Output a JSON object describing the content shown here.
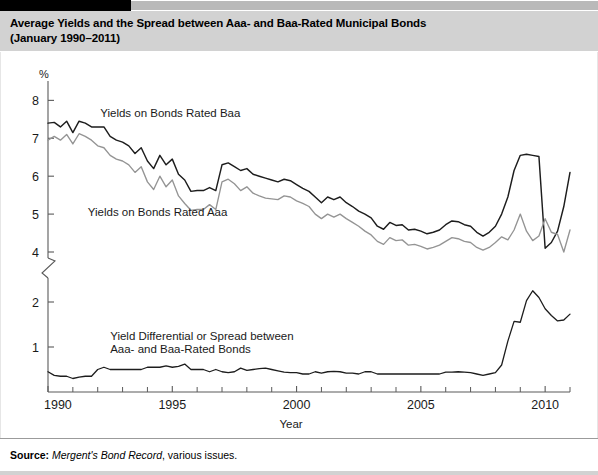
{
  "figure": {
    "title_line1": "Average Yields and the Spread between Aaa- and Baa-Rated Municipal Bonds",
    "title_line2": "(January 1990–2011)",
    "source_label": "Source:",
    "source_italic": "Mergent's Bond Record",
    "source_rest": ", various issues."
  },
  "chart_data": {
    "type": "line",
    "title": "Average Yields and the Spread between Aaa- and Baa-Rated Municipal Bonds (January 1990–2011)",
    "xlabel": "Year",
    "ylabel": "%",
    "grid": false,
    "legend_position": "inline-annotations",
    "axis_note": "y-axis has a scale break between 4 and 2",
    "xlim": [
      1990,
      2011
    ],
    "xticks_major": [
      1990,
      1995,
      2000,
      2005,
      2010
    ],
    "xticks_minor": [
      1991,
      1992,
      1993,
      1994,
      1996,
      1997,
      1998,
      1999,
      2001,
      2002,
      2003,
      2004,
      2006,
      2007,
      2008,
      2009,
      2011
    ],
    "yticks_upper": [
      4,
      5,
      6,
      7,
      8
    ],
    "yticks_lower": [
      1,
      2
    ],
    "ylim_upper": [
      4,
      8.3
    ],
    "ylim_lower": [
      0,
      2.4
    ],
    "annotations": [
      {
        "text": "Yields on Bonds Rated Baa",
        "x": 1992.1,
        "y": 7.55,
        "series": "baa"
      },
      {
        "text": "Yields on Bonds Rated Aaa",
        "x": 1991.6,
        "y": 4.95,
        "series": "aaa"
      },
      {
        "text_line1": "Yield Differential or Spread between",
        "text_line2": "Aaa- and Baa-Rated Bonds",
        "x": 1992.5,
        "y": 1.15,
        "series": "spread"
      }
    ],
    "x": [
      1990.0,
      1990.25,
      1990.5,
      1990.75,
      1991.0,
      1991.25,
      1991.5,
      1991.75,
      1992.0,
      1992.25,
      1992.5,
      1992.75,
      1993.0,
      1993.25,
      1993.5,
      1993.75,
      1994.0,
      1994.25,
      1994.5,
      1994.75,
      1995.0,
      1995.25,
      1995.5,
      1995.75,
      1996.0,
      1996.25,
      1996.5,
      1996.75,
      1997.0,
      1997.25,
      1997.5,
      1997.75,
      1998.0,
      1998.25,
      1998.5,
      1998.75,
      1999.0,
      1999.25,
      1999.5,
      1999.75,
      2000.0,
      2000.25,
      2000.5,
      2000.75,
      2001.0,
      2001.25,
      2001.5,
      2001.75,
      2002.0,
      2002.25,
      2002.5,
      2002.75,
      2003.0,
      2003.25,
      2003.5,
      2003.75,
      2004.0,
      2004.25,
      2004.5,
      2004.75,
      2005.0,
      2005.25,
      2005.5,
      2005.75,
      2006.0,
      2006.25,
      2006.5,
      2006.75,
      2007.0,
      2007.25,
      2007.5,
      2007.75,
      2008.0,
      2008.25,
      2008.5,
      2008.75,
      2009.0,
      2009.25,
      2009.5,
      2009.75,
      2010.0,
      2010.25,
      2010.5,
      2010.75,
      2011.0
    ],
    "series": [
      {
        "name": "Yields on Bonds Rated Baa",
        "key": "baa",
        "color": "#1d1d1d",
        "values": [
          7.4,
          7.42,
          7.3,
          7.45,
          7.15,
          7.45,
          7.4,
          7.3,
          7.3,
          7.3,
          7.05,
          6.95,
          6.9,
          6.8,
          6.6,
          6.75,
          6.4,
          6.2,
          6.55,
          6.3,
          6.45,
          6.05,
          5.9,
          5.6,
          5.62,
          5.62,
          5.7,
          5.62,
          6.3,
          6.35,
          6.25,
          6.15,
          6.2,
          6.05,
          6.0,
          5.95,
          5.9,
          5.85,
          5.92,
          5.88,
          5.78,
          5.68,
          5.6,
          5.45,
          5.3,
          5.45,
          5.38,
          5.45,
          5.3,
          5.2,
          5.08,
          5.0,
          4.9,
          4.68,
          4.6,
          4.78,
          4.7,
          4.72,
          4.58,
          4.6,
          4.55,
          4.48,
          4.52,
          4.58,
          4.72,
          4.82,
          4.8,
          4.72,
          4.68,
          4.52,
          4.42,
          4.52,
          4.68,
          5.0,
          5.45,
          6.15,
          6.55,
          6.58,
          6.55,
          6.52,
          4.1,
          4.25,
          4.55,
          5.2,
          6.1
        ]
      },
      {
        "name": "Yields on Bonds Rated Aaa",
        "key": "aaa",
        "color": "#949494",
        "values": [
          6.95,
          7.05,
          6.95,
          7.1,
          6.85,
          7.12,
          7.05,
          6.95,
          6.8,
          6.75,
          6.55,
          6.45,
          6.4,
          6.3,
          6.1,
          6.25,
          5.85,
          5.65,
          6.0,
          5.72,
          5.9,
          5.48,
          5.28,
          5.1,
          5.12,
          5.12,
          5.25,
          5.12,
          5.85,
          5.92,
          5.8,
          5.62,
          5.72,
          5.55,
          5.48,
          5.42,
          5.4,
          5.38,
          5.48,
          5.45,
          5.35,
          5.28,
          5.2,
          5.0,
          4.88,
          5.0,
          4.92,
          5.0,
          4.88,
          4.78,
          4.68,
          4.55,
          4.45,
          4.28,
          4.2,
          4.38,
          4.3,
          4.32,
          4.18,
          4.2,
          4.15,
          4.08,
          4.12,
          4.18,
          4.28,
          4.38,
          4.35,
          4.28,
          4.25,
          4.12,
          4.05,
          4.12,
          4.25,
          4.4,
          4.32,
          4.58,
          5.0,
          4.55,
          4.3,
          4.42,
          3.85,
          3.55,
          3.5,
          4.0,
          4.58
        ]
      },
      {
        "name": "Yield Differential or Spread between Aaa- and Baa-Rated Bonds",
        "key": "spread",
        "color": "#1d1d1d",
        "values": [
          0.45,
          0.37,
          0.35,
          0.35,
          0.3,
          0.33,
          0.35,
          0.35,
          0.5,
          0.55,
          0.5,
          0.5,
          0.5,
          0.5,
          0.5,
          0.5,
          0.55,
          0.55,
          0.55,
          0.58,
          0.55,
          0.57,
          0.62,
          0.5,
          0.5,
          0.5,
          0.45,
          0.5,
          0.45,
          0.43,
          0.45,
          0.53,
          0.48,
          0.5,
          0.52,
          0.53,
          0.5,
          0.47,
          0.44,
          0.43,
          0.43,
          0.4,
          0.4,
          0.45,
          0.42,
          0.45,
          0.46,
          0.45,
          0.42,
          0.42,
          0.4,
          0.45,
          0.45,
          0.4,
          0.4,
          0.4,
          0.4,
          0.4,
          0.4,
          0.4,
          0.4,
          0.4,
          0.4,
          0.4,
          0.44,
          0.44,
          0.45,
          0.44,
          0.43,
          0.4,
          0.37,
          0.4,
          0.43,
          0.6,
          1.13,
          1.57,
          1.55,
          2.03,
          2.25,
          2.1,
          1.85,
          1.7,
          1.58,
          1.6,
          1.73
        ]
      }
    ],
    "key_points": {
      "baa_start_1990": 7.4,
      "aaa_start_1990": 7.0,
      "baa_peak_2009": 6.6,
      "aaa_trough_2010": 3.5,
      "spread_peak_2009": 2.25,
      "spread_typical_1990s": 0.5,
      "baa_end_2011": 6.1,
      "aaa_end_2011": 4.6,
      "spread_end_2011": 1.73
    }
  }
}
